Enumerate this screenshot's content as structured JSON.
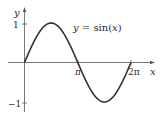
{
  "chart_data": {
    "type": "line",
    "title": "",
    "annotation": "y = sin(x)",
    "xlabel": "x",
    "ylabel": "y",
    "xlim": [
      0,
      6.6
    ],
    "ylim": [
      -1.15,
      1.35
    ],
    "x_ticks": [
      {
        "value": 3.14159,
        "label": "π"
      },
      {
        "value": 6.28318,
        "label": "2π"
      }
    ],
    "y_ticks": [
      {
        "value": 1,
        "label": "1"
      },
      {
        "value": -1,
        "label": "−1"
      }
    ],
    "grid": false,
    "series": [
      {
        "name": "sin(x)",
        "function": "sin(x)",
        "x": [
          0,
          0.785,
          1.571,
          2.356,
          3.142,
          3.927,
          4.712,
          5.498,
          6.283
        ],
        "values": [
          0,
          0.707,
          1,
          0.707,
          0,
          -0.707,
          -1,
          -0.707,
          0
        ]
      }
    ]
  },
  "labels": {
    "y_axis": "y",
    "x_axis": "x",
    "tick_1": "1",
    "tick_neg1": "−1",
    "tick_pi": "π",
    "tick_2pi": "2π",
    "equation_y": "y",
    "equation_eq": " = sin(",
    "equation_x": "x",
    "equation_close": ")"
  },
  "colors": {
    "curve": "#333333",
    "axis": "#555555"
  }
}
